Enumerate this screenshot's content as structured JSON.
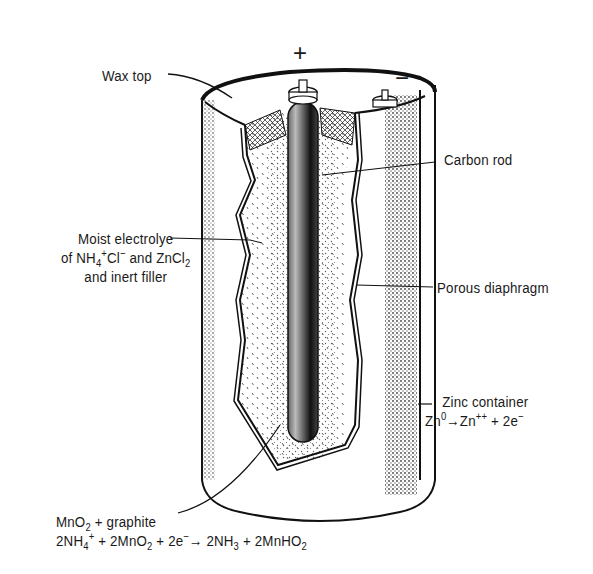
{
  "diagram": {
    "terminals": {
      "positive": "+",
      "negative": "−"
    },
    "labels": {
      "wax_top": "Wax top",
      "carbon_rod": "Carbon rod",
      "electrolyte_line1": "Moist electrolye",
      "electrolyte_line2_a": "of NH",
      "electrolyte_line2_sub": "4",
      "electrolyte_line2_sup": "+",
      "electrolyte_line2_b": "Cl",
      "electrolyte_line2_sup2": "−",
      "electrolyte_line2_c": " and ZnCl",
      "electrolyte_line2_sub2": "2",
      "electrolyte_line3": "and inert filler",
      "porous_diaphragm": "Porous diaphragm",
      "zinc_container": "Zinc container",
      "zinc_reaction_a": "Zn",
      "zinc_reaction_sup1": "0",
      "zinc_reaction_arrow": "→",
      "zinc_reaction_b": "Zn",
      "zinc_reaction_sup2": "++",
      "zinc_reaction_c": " + 2e",
      "zinc_reaction_sup3": "−",
      "cathode_line1_a": "MnO",
      "cathode_line1_sub": "2",
      "cathode_line1_b": " + graphite",
      "cathode_reaction_a": "2NH",
      "cathode_reaction_sub1": "4",
      "cathode_reaction_sup1": "+",
      "cathode_reaction_b": " + 2MnO",
      "cathode_reaction_sub2": "2",
      "cathode_reaction_c": " + 2e",
      "cathode_reaction_sup2": "−",
      "cathode_reaction_arrow": "→",
      "cathode_reaction_d": " 2NH",
      "cathode_reaction_sub3": "3",
      "cathode_reaction_e": " + 2MnHO",
      "cathode_reaction_sub4": "2"
    }
  }
}
